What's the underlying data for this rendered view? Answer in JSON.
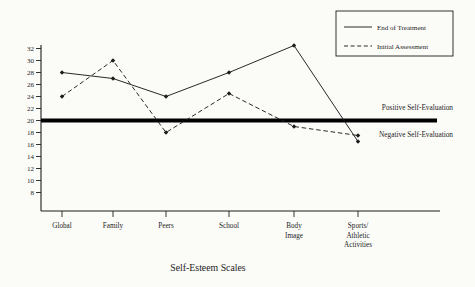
{
  "chart_data": {
    "type": "line",
    "title": "",
    "xlabel": "Self-Esteem Scales",
    "ylabel": "",
    "ylim": [
      8,
      32
    ],
    "ytick_step": 2,
    "grid": false,
    "ytick_labels": [
      "8",
      "10",
      "12",
      "14",
      "16",
      "18",
      "20",
      "22",
      "24",
      "26",
      "28",
      "30",
      "32"
    ],
    "categories": [
      "Global",
      "Family",
      "Peers",
      "School",
      "Body Image",
      "Sports/Athletic Activities"
    ],
    "category_label_lines": [
      [
        "Global"
      ],
      [
        "Family"
      ],
      [
        "Peers"
      ],
      [
        "School"
      ],
      [
        "Body",
        "Image"
      ],
      [
        "Sports/",
        "Athletic",
        "Activities"
      ]
    ],
    "series": [
      {
        "name": "End of Treatment",
        "style": "solid",
        "values": [
          28,
          27,
          24,
          28,
          32.5,
          16.5
        ]
      },
      {
        "name": "Initial Assessment",
        "style": "dashed",
        "values": [
          24,
          30,
          18,
          24.5,
          19,
          17.5
        ]
      }
    ],
    "reference_line": {
      "value": 20,
      "label_above": "Positive Self-Evaluation",
      "label_below": "Negative Self-Evaluation"
    },
    "legend": {
      "position": "top-right",
      "entries": [
        "End of Treatment",
        "Initial Assessment"
      ]
    },
    "colors": {
      "line": "#1d1d1d",
      "reference_line": "#000000",
      "background": "#fbfbf8"
    }
  }
}
